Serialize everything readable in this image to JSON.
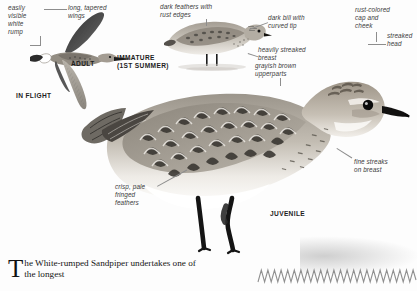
{
  "page": {
    "species": "White-rumped Sandpiper",
    "background_color": "#fdfdfd",
    "ink_color": "#3a3a3a",
    "leader_color": "#8d8d8d"
  },
  "plates": [
    {
      "id": "in-flight",
      "caption": "IN FLIGHT",
      "subcaption": "ADULT"
    },
    {
      "id": "immature",
      "caption": "IMMATURE\n(1ST SUMMER)"
    },
    {
      "id": "juvenile",
      "caption": "JUVENILE"
    }
  ],
  "captions": {
    "in_flight": "IN FLIGHT",
    "adult": "ADULT",
    "immature": "IMMATURE\n(1ST SUMMER)",
    "juvenile": "JUVENILE"
  },
  "annotations": [
    {
      "id": "white-rump",
      "text": "easily\nvisible\nwhite\nrump"
    },
    {
      "id": "tapered-wings",
      "text": "long, tapered\nwings"
    },
    {
      "id": "rust-edges",
      "text": "dark feathers with\nrust edges"
    },
    {
      "id": "dark-bill",
      "text": "dark bill with\ncurved tip"
    },
    {
      "id": "streaked-breast",
      "text": "heavily streaked\nbreast"
    },
    {
      "id": "upperparts",
      "text": "grayish brown\nupperparts"
    },
    {
      "id": "rust-cap",
      "text": "rust-colored\ncap and\ncheek"
    },
    {
      "id": "streaked-head",
      "text": "streaked\nhead"
    },
    {
      "id": "fine-streaks",
      "text": "fine streaks\non breast"
    },
    {
      "id": "fringed",
      "text": "crisp, pale\nfringed\nfeathers"
    }
  ],
  "body": {
    "dropcap": "T",
    "text": "he White-rumped Sandpiper undertakes one of the longest"
  },
  "decor": {
    "rule": "zigzag-rule"
  }
}
